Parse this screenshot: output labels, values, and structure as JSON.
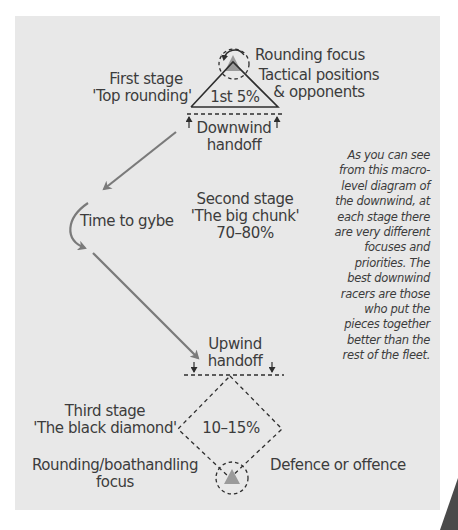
{
  "diagram": {
    "colors": {
      "panel_bg": "#e8e8e8",
      "line": "#2e2e2e",
      "path_arrow": "#7a7a7a",
      "mark": "#9a9a9a",
      "corner": "#4a4a4a"
    },
    "first_stage": {
      "title": "First stage",
      "subtitle": "'Top rounding'",
      "percent": "1st 5%",
      "rounding_focus": "Rounding focus",
      "tactical_line1": "Tactical positions",
      "tactical_line2": "& opponents",
      "handoff_line1": "Downwind",
      "handoff_line2": "handoff"
    },
    "gybe": {
      "label": "Time to gybe"
    },
    "second_stage": {
      "title": "Second stage",
      "subtitle": "'The big chunk'",
      "percent": "70–80%"
    },
    "upwind_handoff": {
      "line1": "Upwind",
      "line2": "handoff"
    },
    "third_stage": {
      "title": "Third stage",
      "subtitle": "'The black diamond'",
      "percent": "10–15%",
      "rounding_line1": "Rounding/boathandling",
      "rounding_line2": "focus",
      "defence": "Defence or offence"
    },
    "caption": {
      "lines": [
        "As you can see",
        "from this macro-",
        "level diagram of",
        "the downwind, at",
        "each stage there",
        "are very different",
        "focuses and",
        "priorities. The",
        "best downwind",
        "racers are those",
        "who put the",
        "pieces together",
        "better than the",
        "rest of the fleet."
      ]
    }
  }
}
